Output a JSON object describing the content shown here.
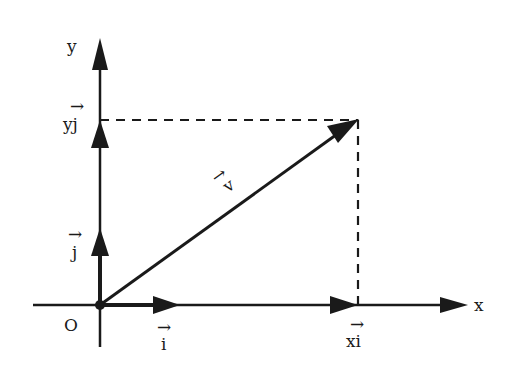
{
  "diagram": {
    "type": "vector-decomposition",
    "stroke_color": "#1a1a1a",
    "background": "#ffffff",
    "axes": {
      "x_label": "x",
      "y_label": "y",
      "origin_label": "O"
    },
    "unit_vectors": {
      "i_label": "i",
      "j_label": "j",
      "arrow_glyph": "→"
    },
    "components": {
      "x_component_label": "xi",
      "y_component_label": "yj"
    },
    "vector": {
      "label": "v"
    }
  }
}
